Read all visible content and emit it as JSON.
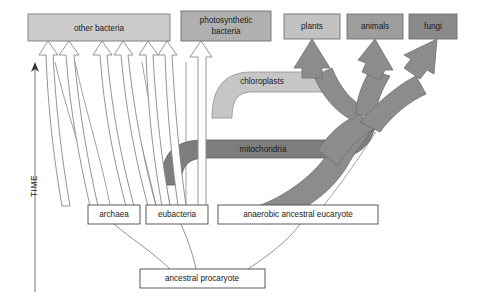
{
  "diagram": {
    "canvas": {
      "width": 478,
      "height": 302,
      "background": "#ffffff"
    },
    "colors": {
      "box_light": "#cccccc",
      "box_medium": "#aaaaaa",
      "box_dark": "#8a8a8a",
      "box_white": "#ffffff",
      "band_light": "#c4c4c4",
      "band_dark": "#7d7d7d",
      "trunk_gray": "#8c8c8c",
      "outline": "#4d4d4d",
      "line": "#808080",
      "text": "#1a1a1a"
    },
    "boxes": [
      {
        "id": "other-bacteria",
        "label": "other bacteria",
        "fill": "#cccccc",
        "x": 28,
        "y": 14,
        "w": 142,
        "h": 27
      },
      {
        "id": "photosynthetic-bacteria",
        "label": "photosynthetic bacteria",
        "line1": "photosynthetic",
        "line2": "bacteria",
        "fill": "#b0b0b0",
        "x": 181,
        "y": 11,
        "w": 90,
        "h": 30
      },
      {
        "id": "plants",
        "label": "plants",
        "fill": "#c2c2c2",
        "x": 284,
        "y": 14,
        "w": 56,
        "h": 25
      },
      {
        "id": "animals",
        "label": "animals",
        "fill": "#9d9d9d",
        "x": 347,
        "y": 14,
        "w": 56,
        "h": 25
      },
      {
        "id": "fungi",
        "label": "fungi",
        "fill": "#8a8a8a",
        "x": 409,
        "y": 14,
        "w": 48,
        "h": 25
      },
      {
        "id": "archaea",
        "label": "archaea",
        "fill": "#ffffff",
        "x": 88,
        "y": 205,
        "w": 52,
        "h": 19
      },
      {
        "id": "eubacteria",
        "label": "eubacteria",
        "fill": "#ffffff",
        "x": 146,
        "y": 205,
        "w": 62,
        "h": 19
      },
      {
        "id": "anaerobic-ancestral-eucaryote",
        "label": "anaerobic ancestral eucaryote",
        "fill": "#ffffff",
        "x": 218,
        "y": 205,
        "w": 160,
        "h": 19
      },
      {
        "id": "ancestral-procaryote",
        "label": "ancestral procaryote",
        "fill": "#ffffff",
        "x": 140,
        "y": 269,
        "w": 125,
        "h": 19
      }
    ],
    "bands": [
      {
        "id": "chloroplasts",
        "label": "chloroplasts",
        "fill": "#c4c4c4",
        "label_x": 262,
        "label_y": 81
      },
      {
        "id": "mitochondria",
        "label": "mitochondria",
        "fill": "#7d7d7d",
        "label_x": 263,
        "label_y": 149
      }
    ],
    "axis": {
      "id": "time-axis",
      "label": "TIME",
      "direction": "upward",
      "x": 35,
      "top_y": 64,
      "bottom_y": 292,
      "label_x": 35,
      "label_y": 186
    },
    "hollow_arrows": [
      {
        "id": "archaea-to-other-bacteria-1",
        "target": "other bacteria",
        "source": "archaea"
      },
      {
        "id": "archaea-to-other-bacteria-2",
        "target": "other bacteria",
        "source": "archaea"
      },
      {
        "id": "eubacteria-to-other-bacteria-1",
        "target": "other bacteria",
        "source": "eubacteria"
      },
      {
        "id": "eubacteria-to-other-bacteria-2",
        "target": "other bacteria",
        "source": "eubacteria"
      },
      {
        "id": "eubacteria-to-other-bacteria-3",
        "target": "other bacteria",
        "source": "eubacteria"
      },
      {
        "id": "eubacteria-to-photosynthetic-bacteria",
        "target": "photosynthetic bacteria",
        "source": "eubacteria"
      }
    ],
    "filled_arrows": [
      {
        "id": "eucaryote-to-plants",
        "target": "plants"
      },
      {
        "id": "eucaryote-to-animals",
        "target": "animals"
      },
      {
        "id": "eucaryote-to-fungi",
        "target": "fungi"
      }
    ],
    "descent_lines": [
      {
        "id": "procaryote-to-archaea"
      },
      {
        "id": "procaryote-to-eubacteria"
      },
      {
        "id": "procaryote-to-eucaryote"
      }
    ]
  }
}
